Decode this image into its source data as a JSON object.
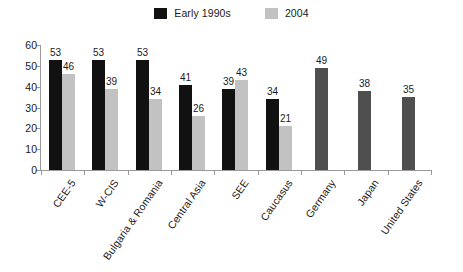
{
  "chart_data": {
    "type": "bar",
    "title": "",
    "subtitle": "",
    "xlabel": "",
    "ylabel": "",
    "ylim": [
      0,
      60
    ],
    "yticks": [
      0,
      10,
      20,
      30,
      40,
      50,
      60
    ],
    "grid": false,
    "legend_position": "top-center",
    "categories": [
      "CEE-5",
      "W-CIS",
      "Bulgaria & Romania",
      "Central Asia",
      "SEE",
      "Caucasus",
      "Germany",
      "Japan",
      "United States"
    ],
    "series": [
      {
        "name": "Early 1990s",
        "color": "#111111",
        "values": [
          53,
          53,
          53,
          41,
          39,
          34,
          null,
          null,
          null
        ]
      },
      {
        "name": "2004",
        "color": "#c2c2c2",
        "values": [
          46,
          39,
          34,
          26,
          43,
          21,
          null,
          null,
          null
        ]
      },
      {
        "name": "Reference",
        "color": "#4f4f4f",
        "values": [
          null,
          null,
          null,
          null,
          null,
          null,
          49,
          38,
          35
        ]
      }
    ]
  },
  "legend": {
    "items": [
      {
        "label": "Early 1990s",
        "color": "#111111"
      },
      {
        "label": "2004",
        "color": "#c2c2c2"
      }
    ]
  },
  "axis": {
    "tick_labels": [
      "0",
      "10",
      "20",
      "30",
      "40",
      "50",
      "60"
    ]
  },
  "colors": {
    "axis_line": "#9a9a9a",
    "series_early_1990s": "#111111",
    "series_2004": "#c2c2c2",
    "series_reference": "#4f4f4f",
    "background": "#ffffff",
    "text": "#1a1a1a"
  }
}
